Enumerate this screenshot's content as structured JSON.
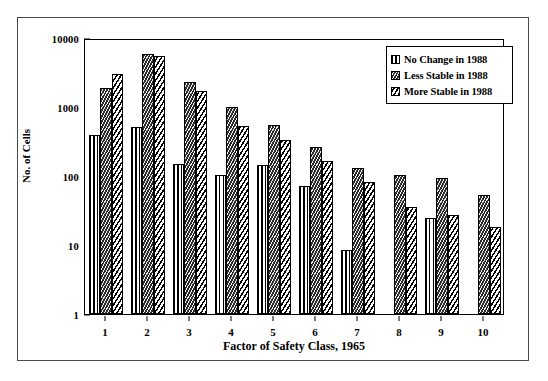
{
  "chart_data": {
    "type": "bar",
    "title": "",
    "xlabel": "Factor of Safety Class, 1965",
    "ylabel": "No. of Cells",
    "categories": [
      "1",
      "2",
      "3",
      "4",
      "5",
      "6",
      "7",
      "8",
      "9",
      "10"
    ],
    "yscale": "log",
    "ylim": [
      1,
      10000
    ],
    "yticks": [
      "1",
      "10",
      "100",
      "1000",
      "10000"
    ],
    "grid": false,
    "legend_position": "top-right",
    "series": [
      {
        "name": "No Change in 1988",
        "pattern": "vertical-lines",
        "values": [
          390,
          520,
          150,
          105,
          145,
          72,
          8.5,
          null,
          25,
          null
        ]
      },
      {
        "name": "Less Stable in 1988",
        "pattern": "dark-herringbone",
        "values": [
          1900,
          5800,
          2300,
          1000,
          540,
          265,
          130,
          103,
          95,
          53
        ]
      },
      {
        "name": "More Stable in 1988",
        "pattern": "diagonal-hatch",
        "values": [
          3000,
          5500,
          1700,
          530,
          330,
          165,
          83,
          36,
          27,
          18
        ]
      }
    ]
  },
  "legend": {
    "items": [
      {
        "label": "No Change in 1988"
      },
      {
        "label": "Less Stable in 1988"
      },
      {
        "label": "More Stable in 1988"
      }
    ]
  },
  "colors": {
    "ink": "#000000",
    "frame": "#4a4a4a",
    "background": "#ffffff",
    "dark_fill": "#2b2b2b"
  }
}
